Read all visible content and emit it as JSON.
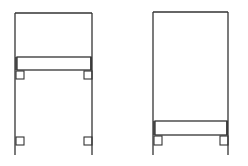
{
  "diagram": {
    "stroke_color": "#333333",
    "background": "#ffffff",
    "figures": [
      {
        "id": "left",
        "frame": {
          "x1": 15,
          "x2": 92,
          "top": 13,
          "bottom": 155
        },
        "panel": {
          "top": 13,
          "bottom": 57
        },
        "bar": {
          "x": 17,
          "y": 57,
          "w": 74,
          "h": 13
        },
        "brackets": [
          {
            "x": 16,
            "y": 71,
            "w": 8,
            "h": 8
          },
          {
            "x": 84,
            "y": 71,
            "w": 8,
            "h": 8
          },
          {
            "x": 16,
            "y": 137,
            "w": 8,
            "h": 8
          },
          {
            "x": 84,
            "y": 137,
            "w": 8,
            "h": 8
          }
        ]
      },
      {
        "id": "right",
        "frame": {
          "x1": 153,
          "x2": 228,
          "top": 12,
          "bottom": 155
        },
        "panel": {
          "top": 12,
          "bottom": 121
        },
        "bar": {
          "x": 155,
          "y": 121,
          "w": 72,
          "h": 14
        },
        "brackets": [
          {
            "x": 154,
            "y": 136,
            "w": 8,
            "h": 9
          },
          {
            "x": 220,
            "y": 136,
            "w": 8,
            "h": 9
          }
        ]
      }
    ]
  }
}
